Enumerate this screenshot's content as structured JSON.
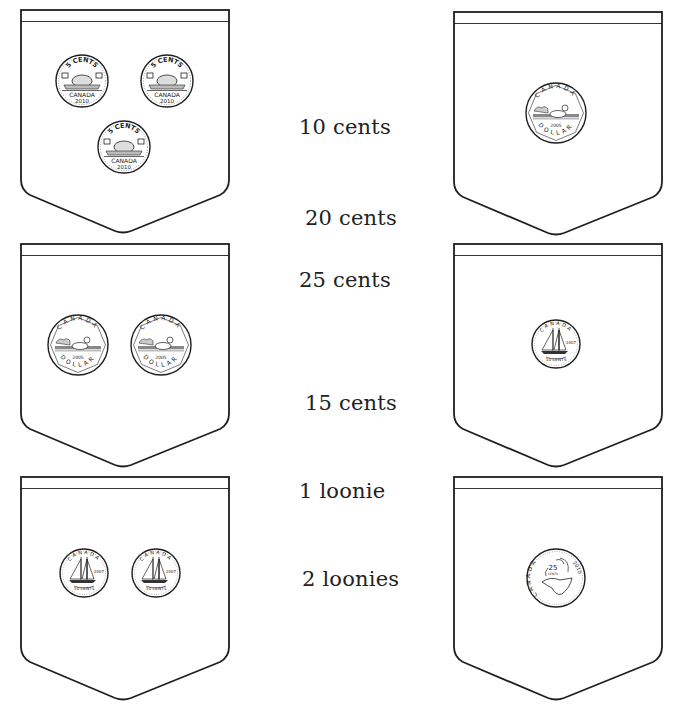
{
  "worksheet": {
    "colors": {
      "ink": "#1e1e1e",
      "background": "#ffffff"
    },
    "answer_choices": [
      {
        "label": "10 cents",
        "x": 299,
        "y": 115
      },
      {
        "label": "20 cents",
        "x": 305,
        "y": 206
      },
      {
        "label": "25 cents",
        "x": 299,
        "y": 268
      },
      {
        "label": "15 cents",
        "x": 305,
        "y": 391
      },
      {
        "label": "1 loonie",
        "x": 299,
        "y": 479
      },
      {
        "label": "2 loonies",
        "x": 302,
        "y": 567
      }
    ],
    "pockets": [
      {
        "id": "pocket-top-left",
        "coins": [
          {
            "type": "nickel",
            "top": "5 CENTS",
            "mid": "CANADA",
            "year": "2010"
          },
          {
            "type": "nickel",
            "top": "5 CENTS",
            "mid": "CANADA",
            "year": "2010"
          },
          {
            "type": "nickel",
            "top": "5 CENTS",
            "mid": "CANADA",
            "year": "2010"
          }
        ]
      },
      {
        "id": "pocket-top-right",
        "coins": [
          {
            "type": "loonie",
            "top": "CANADA",
            "year": "2005",
            "bottom": "DOLLAR"
          }
        ]
      },
      {
        "id": "pocket-middle-left",
        "coins": [
          {
            "type": "loonie",
            "top": "CANADA",
            "year": "2005",
            "bottom": "DOLLAR"
          },
          {
            "type": "loonie",
            "top": "CANADA",
            "year": "2005",
            "bottom": "DOLLAR"
          }
        ]
      },
      {
        "id": "pocket-middle-right",
        "coins": [
          {
            "type": "dime",
            "top": "CANADA",
            "year": "2007",
            "bottom": "10 CENTS"
          }
        ]
      },
      {
        "id": "pocket-bottom-left",
        "coins": [
          {
            "type": "dime",
            "top": "CANADA",
            "year": "2007",
            "bottom": "10 CENTS"
          },
          {
            "type": "dime",
            "top": "CANADA",
            "year": "2007",
            "bottom": "10 CENTS"
          }
        ]
      },
      {
        "id": "pocket-bottom-right",
        "coins": [
          {
            "type": "quarter",
            "top": "CANADA",
            "value": "25",
            "unit": "CENTS",
            "year": "2010"
          }
        ]
      }
    ]
  }
}
